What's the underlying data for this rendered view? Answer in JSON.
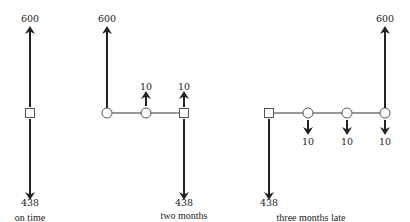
{
  "diagrams": [
    {
      "caption": "on time",
      "up_values": [
        "600"
      ],
      "down_values": [
        "438"
      ]
    },
    {
      "caption_line1": "two months",
      "caption_line2": "early",
      "up_values": [
        "600",
        "10",
        "10"
      ],
      "down_values": [
        "438"
      ]
    },
    {
      "caption": "three months late",
      "up_values": [
        "600"
      ],
      "down_values": [
        "438",
        "10",
        "10",
        "10"
      ]
    }
  ],
  "legend_symbols": {
    "square": "decision node / time of payment",
    "circle": "time period node"
  },
  "colors": {
    "stroke": "#222222",
    "background": "#ffffff"
  }
}
